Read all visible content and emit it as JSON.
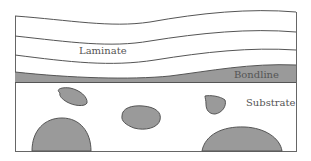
{
  "diagram": {
    "labels": {
      "laminate": "Laminate",
      "bondline": "Bondline",
      "substrate": "Substrate"
    },
    "colors": {
      "line": "#555555",
      "fill_gray": "#9a9a9a",
      "background": "#ffffff"
    }
  }
}
